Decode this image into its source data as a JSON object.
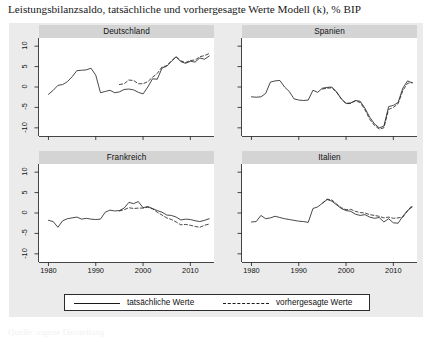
{
  "figure": {
    "caption": "Leistungsbilanzsaldo, tatsächliche und vorhergesagte Werte Modell (k), % BIP",
    "source_note": "Quelle: eigene Darstellung"
  },
  "legend": {
    "items": [
      {
        "label": "tatsächliche Werte",
        "style": "solid"
      },
      {
        "label": "vorhergesagte Werte",
        "style": "dashed"
      }
    ]
  },
  "axis": {
    "ylabel": "",
    "xlabel": "",
    "yticks": [
      10,
      5,
      0,
      -5,
      -10
    ],
    "ytick_labels": [
      "10",
      "5",
      "0",
      "-5",
      "-10"
    ],
    "xticks": [
      1980,
      1990,
      2000,
      2010
    ],
    "xtick_labels": [
      "1980",
      "1990",
      "2000",
      "2010"
    ],
    "ylim": [
      -12,
      12
    ],
    "xlim": [
      1978,
      2015
    ]
  },
  "colors": {
    "panel_background": "#ffffff",
    "figure_background": "#ebebeb",
    "title_strip": "#d4d4d4",
    "line": "#1a1a1a",
    "text": "#111111"
  },
  "chart_data": {
    "type": "line",
    "title": "Leistungsbilanzsaldo, tatsächliche und vorhergesagte Werte Modell (k), % BIP",
    "xlabel": "",
    "ylabel": "% BIP",
    "xlim": [
      1978,
      2015
    ],
    "ylim": [
      -12,
      12
    ],
    "grid": false,
    "legend_position": "bottom",
    "panel_layout": "2x2",
    "panels": [
      {
        "name": "Deutschland",
        "x": [
          1980,
          1981,
          1982,
          1983,
          1984,
          1985,
          1986,
          1987,
          1988,
          1989,
          1990,
          1991,
          1992,
          1993,
          1994,
          1995,
          1996,
          1997,
          1998,
          1999,
          2000,
          2001,
          2002,
          2003,
          2004,
          2005,
          2006,
          2007,
          2008,
          2009,
          2010,
          2011,
          2012,
          2013,
          2014
        ],
        "series": [
          {
            "name": "tatsächliche Werte",
            "style": "solid",
            "values": [
              -1.8,
              -0.8,
              0.4,
              0.6,
              1.3,
              2.5,
              4.0,
              4.1,
              4.2,
              4.6,
              2.9,
              -1.4,
              -1.1,
              -0.8,
              -1.4,
              -1.2,
              -0.6,
              -0.5,
              -0.7,
              -1.3,
              -1.7,
              0.0,
              2.0,
              1.9,
              4.6,
              5.1,
              6.3,
              7.4,
              6.2,
              5.8,
              6.3,
              6.1,
              7.1,
              6.8,
              7.6
            ]
          },
          {
            "name": "vorhergesagte Werte",
            "style": "dashed",
            "values": [
              null,
              null,
              null,
              null,
              null,
              null,
              null,
              null,
              null,
              null,
              null,
              null,
              null,
              null,
              null,
              0.6,
              0.8,
              1.7,
              1.6,
              0.8,
              0.8,
              1.3,
              2.4,
              3.3,
              4.9,
              5.2,
              6.4,
              7.4,
              6.4,
              6.0,
              6.5,
              6.6,
              7.4,
              7.7,
              8.2
            ]
          }
        ]
      },
      {
        "name": "Spanien",
        "x": [
          1980,
          1981,
          1982,
          1983,
          1984,
          1985,
          1986,
          1987,
          1988,
          1989,
          1990,
          1991,
          1992,
          1993,
          1994,
          1995,
          1996,
          1997,
          1998,
          1999,
          2000,
          2001,
          2002,
          2003,
          2004,
          2005,
          2006,
          2007,
          2008,
          2009,
          2010,
          2011,
          2012,
          2013,
          2014
        ],
        "series": [
          {
            "name": "tatsächliche Werte",
            "style": "solid",
            "values": [
              -2.4,
              -2.5,
              -2.4,
              -1.6,
              1.2,
              1.5,
              1.6,
              0.0,
              -1.1,
              -2.9,
              -3.2,
              -3.3,
              -3.2,
              -0.8,
              -1.3,
              -0.3,
              -0.1,
              0.0,
              -1.2,
              -2.9,
              -4.0,
              -3.9,
              -3.3,
              -3.5,
              -5.2,
              -7.4,
              -9.0,
              -10.0,
              -9.6,
              -4.8,
              -4.5,
              -3.8,
              -0.3,
              1.5,
              1.0
            ]
          },
          {
            "name": "vorhergesagte Werte",
            "style": "dashed",
            "values": [
              null,
              null,
              null,
              null,
              null,
              null,
              null,
              null,
              null,
              null,
              null,
              null,
              null,
              null,
              null,
              -0.5,
              -0.3,
              -0.2,
              -1.3,
              -2.9,
              -4.1,
              -4.0,
              -3.4,
              -3.8,
              -5.6,
              -7.9,
              -9.4,
              -10.3,
              -10.0,
              -5.5,
              -5.0,
              -4.1,
              -0.9,
              0.9,
              1.1
            ]
          }
        ]
      },
      {
        "name": "Frankreich",
        "x": [
          1980,
          1981,
          1982,
          1983,
          1984,
          1985,
          1986,
          1987,
          1988,
          1989,
          1990,
          1991,
          1992,
          1993,
          1994,
          1995,
          1996,
          1997,
          1998,
          1999,
          2000,
          2001,
          2002,
          2003,
          2004,
          2005,
          2006,
          2007,
          2008,
          2009,
          2010,
          2011,
          2012,
          2013,
          2014
        ],
        "series": [
          {
            "name": "tatsächliche Werte",
            "style": "solid",
            "values": [
              -1.8,
              -2.1,
              -3.5,
              -1.9,
              -1.4,
              -1.2,
              -1.0,
              -1.5,
              -1.3,
              -1.5,
              -1.6,
              -1.5,
              0.2,
              0.7,
              0.5,
              0.6,
              1.2,
              2.6,
              2.3,
              2.8,
              1.3,
              1.6,
              1.1,
              0.6,
              0.2,
              -0.5,
              -0.6,
              -1.0,
              -1.7,
              -1.5,
              -1.6,
              -1.9,
              -2.1,
              -1.8,
              -1.4
            ]
          },
          {
            "name": "vorhergesagte Werte",
            "style": "dashed",
            "values": [
              null,
              null,
              null,
              null,
              null,
              null,
              null,
              null,
              null,
              null,
              null,
              null,
              null,
              null,
              null,
              0.5,
              0.8,
              1.3,
              1.1,
              1.2,
              1.2,
              1.4,
              1.0,
              0.2,
              -0.5,
              -1.2,
              -1.6,
              -2.2,
              -2.9,
              -2.8,
              -3.0,
              -3.3,
              -3.5,
              -3.0,
              -2.7
            ]
          }
        ]
      },
      {
        "name": "Italien",
        "x": [
          1980,
          1981,
          1982,
          1983,
          1984,
          1985,
          1986,
          1987,
          1988,
          1989,
          1990,
          1991,
          1992,
          1993,
          1994,
          1995,
          1996,
          1997,
          1998,
          1999,
          2000,
          2001,
          2002,
          2003,
          2004,
          2005,
          2006,
          2007,
          2008,
          2009,
          2010,
          2011,
          2012,
          2013,
          2014
        ],
        "series": [
          {
            "name": "tatsächliche Werte",
            "style": "solid",
            "values": [
              -2.2,
              -2.1,
              -0.6,
              -1.4,
              -1.2,
              -0.8,
              -1.1,
              -1.4,
              -1.6,
              -1.8,
              -2.0,
              -2.1,
              -2.3,
              1.1,
              1.5,
              2.4,
              3.3,
              2.9,
              2.0,
              1.1,
              0.6,
              0.4,
              -0.3,
              -0.6,
              -0.4,
              -1.0,
              -1.3,
              -1.1,
              -2.2,
              -1.4,
              -2.4,
              -2.5,
              -0.8,
              0.6,
              1.5
            ]
          },
          {
            "name": "vorhergesagte Werte",
            "style": "dashed",
            "values": [
              null,
              null,
              null,
              null,
              null,
              null,
              null,
              null,
              null,
              null,
              null,
              null,
              null,
              null,
              null,
              2.4,
              3.4,
              3.2,
              2.2,
              1.3,
              0.8,
              0.9,
              0.4,
              0.1,
              0.0,
              -0.4,
              -0.6,
              -0.8,
              -1.2,
              -1.0,
              -1.3,
              -1.2,
              -1.0,
              0.5,
              1.9
            ]
          }
        ]
      }
    ]
  }
}
